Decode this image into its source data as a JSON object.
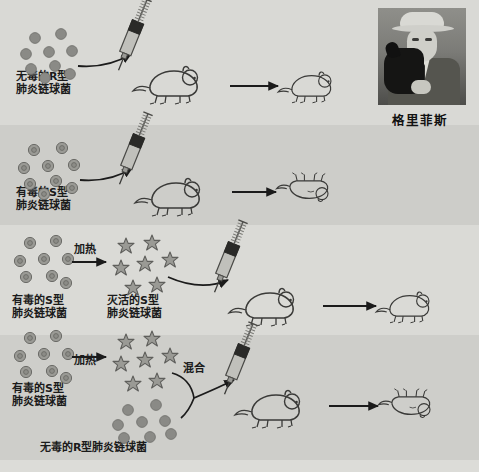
{
  "figure": {
    "title_caption": "格里菲斯",
    "portrait_alt": "griffith-portrait"
  },
  "rows": [
    {
      "id": "row-1",
      "bacteria_label": "无毒的R型\n肺炎链球菌",
      "bacteria_type": "R",
      "outcome": "mouse-lives",
      "arrow_label": "",
      "syringe": "syringe-icon"
    },
    {
      "id": "row-2",
      "bacteria_label": "有毒的S型\n肺炎链球菌",
      "bacteria_type": "S",
      "outcome": "mouse-dies",
      "arrow_label": "",
      "syringe": "syringe-icon"
    },
    {
      "id": "row-3",
      "bacteria_label": "有毒的S型\n肺炎链球菌",
      "bacteria_type": "S",
      "process_label": "加热",
      "product_label": "灭活的S型\n肺炎链球菌",
      "outcome": "mouse-lives",
      "syringe": "syringe-icon"
    },
    {
      "id": "row-4",
      "bacteria_label": "有毒的S型\n肺炎链球菌",
      "bacteria_type": "S",
      "process_label": "加热",
      "mix_label": "混合",
      "second_bacteria_label": "无毒的R型肺炎链球菌",
      "second_bacteria_type": "R",
      "outcome": "mouse-dies",
      "syringe": "syringe-icon"
    }
  ],
  "colors": {
    "background": "#d6d6d2",
    "band_light": "#dadad6",
    "band_dark": "#cdcdc9",
    "bacteria_fill": "#8a8a86",
    "ink": "#1b1b1b"
  }
}
